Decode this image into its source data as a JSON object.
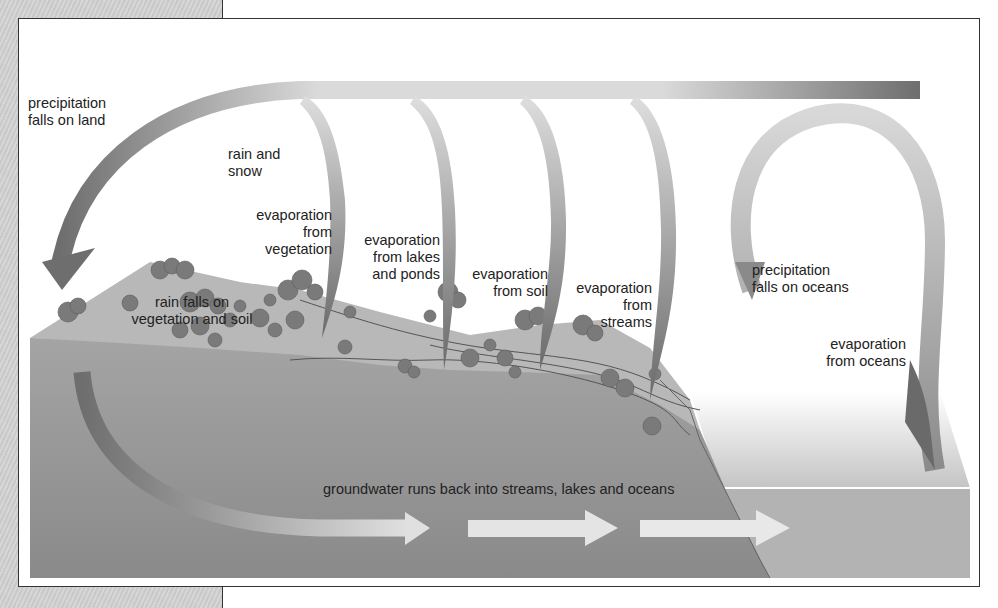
{
  "diagram": {
    "type": "water-cycle",
    "colors": {
      "arrow_dark": "#6e6e6e",
      "arrow_light": "#dcdcdc",
      "land_top": "#b9b9b9",
      "cross_section": "#8e8e8e",
      "ocean": "#bdbdbd",
      "groundwater_arrow": "#e6e6e6",
      "trees": "#7a7a7a",
      "background_panel": "#cfcfcf"
    },
    "labels": {
      "precip_land": [
        "precipitation",
        "falls on land"
      ],
      "rain_snow": [
        "rain and",
        "snow"
      ],
      "evap_vegetation": [
        "evaporation",
        "from",
        "vegetation"
      ],
      "evap_lakes": [
        "evaporation",
        "from lakes",
        "and ponds"
      ],
      "evap_soil": [
        "evaporation",
        "from soil"
      ],
      "evap_streams": [
        "evaporation",
        "from",
        "streams"
      ],
      "precip_oceans": [
        "precipitation",
        "falls on oceans"
      ],
      "evap_oceans": [
        "evaporation",
        "from oceans"
      ],
      "rain_vegetation": [
        "rain falls on",
        "vegetation and soil"
      ],
      "groundwater": "groundwater runs back into streams, lakes and oceans"
    }
  }
}
